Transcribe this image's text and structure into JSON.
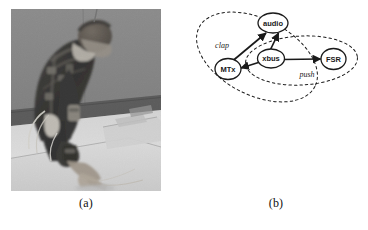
{
  "figure": {
    "background_color": "#ffffff",
    "ink_color": "#1a1a1a",
    "panels": [
      {
        "id": "a",
        "caption": "(a)",
        "type": "photograph",
        "description": "grayscale photo of a person wearing an inertial motion-capture suit, bent forward with one hand pressing on a white table surface"
      },
      {
        "id": "b",
        "caption": "(b)",
        "type": "graph-diagram"
      }
    ]
  },
  "diagram": {
    "nodes": [
      {
        "id": "audio",
        "label": "audio",
        "cx": 222,
        "cy": 30,
        "rx": 26,
        "ry": 16
      },
      {
        "id": "mtx",
        "label": "MTx",
        "cx": 132,
        "cy": 122,
        "rx": 22,
        "ry": 17
      },
      {
        "id": "xbus",
        "label": "xbus",
        "cx": 218,
        "cy": 101,
        "rx": 23,
        "ry": 16
      },
      {
        "id": "fsr",
        "label": "FSR",
        "cx": 343,
        "cy": 102,
        "rx": 21,
        "ry": 17
      }
    ],
    "edges": [
      {
        "from": "mtx",
        "to": "audio",
        "arrow": "end"
      },
      {
        "from": "xbus",
        "to": "audio",
        "arrow": "end"
      },
      {
        "from": "xbus",
        "to": "mtx",
        "arrow": "end"
      },
      {
        "from": "xbus",
        "to": "fsr",
        "arrow": "end"
      }
    ],
    "groups": [
      {
        "id": "clap",
        "label": "clap",
        "label_x": 120,
        "label_y": 74,
        "style": "dashed-ellipse",
        "members": [
          "audio",
          "mtx",
          "xbus"
        ]
      },
      {
        "id": "push",
        "label": "push",
        "label_x": 290,
        "label_y": 133,
        "style": "dashed-ellipse",
        "members": [
          "xbus",
          "fsr"
        ]
      }
    ]
  }
}
